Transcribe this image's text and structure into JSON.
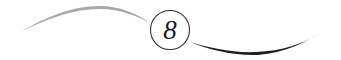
{
  "divider": {
    "number": "8",
    "colors": {
      "left_swoosh": "#a8a8a8",
      "right_swoosh": "#1e1e1e",
      "circle_stroke": "#333333",
      "number": "#1a1a1a"
    }
  }
}
